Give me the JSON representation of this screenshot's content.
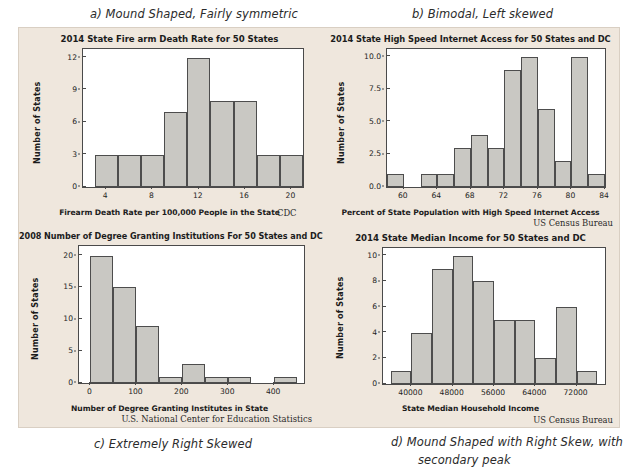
{
  "captions": {
    "a": "a) Mound Shaped, Fairly symmetric",
    "b": "b) Bimodal, Left skewed",
    "c": "c) Extremely Right Skewed",
    "d_line1": "d)  Mound Shaped with Right Skew, with",
    "d_line2": "secondary peak"
  },
  "colors": {
    "panel_background": "#efe7dd",
    "plot_background": "#ffffff",
    "bar_fill": "#c9c8c3",
    "bar_edge": "#4d4d4d",
    "axis": "#4a4a4a",
    "text": "#1c1c1c",
    "page_background": "#ffffff"
  },
  "chart_data": [
    {
      "id": "a",
      "type": "bar",
      "title": "2014 State Fire arm Death Rate for 50 States",
      "xlabel": "Firearm Death Rate  per 100,000 People in the State",
      "ylabel": "Number of States",
      "source": "CDC",
      "bin_width": 2,
      "bin_starts": [
        3,
        5,
        7,
        9,
        11,
        13,
        15,
        17,
        19
      ],
      "categories": [
        "3-5",
        "5-7",
        "7-9",
        "9-11",
        "11-13",
        "13-15",
        "15-17",
        "17-19",
        "19-21"
      ],
      "values": [
        3,
        3,
        3,
        7,
        12,
        8,
        8,
        3,
        3
      ],
      "xlim": [
        2,
        21
      ],
      "ylim": [
        0,
        12.8
      ],
      "xticks": [
        4,
        8,
        12,
        16,
        20
      ],
      "xticklabels": [
        "4",
        "8",
        "12",
        "16",
        "20"
      ],
      "yticks": [
        0,
        3,
        6,
        9,
        12
      ],
      "yticklabels": [
        "0",
        "3",
        "6",
        "9",
        "12"
      ],
      "grid": false,
      "legend": "none"
    },
    {
      "id": "b",
      "type": "bar",
      "title": "2014 State High Speed Internet Access for 50 States and DC",
      "xlabel": "Percent of State Population with High Speed Internet Access",
      "ylabel": "Number of States",
      "source": "US Census Bureau",
      "bin_width": 2,
      "bin_starts": [
        58,
        60,
        62,
        64,
        66,
        68,
        70,
        72,
        74,
        76,
        78,
        80,
        82
      ],
      "categories": [
        "58-60",
        "60-62",
        "62-64",
        "64-66",
        "66-68",
        "68-70",
        "70-72",
        "72-74",
        "74-76",
        "76-78",
        "78-80",
        "80-82",
        "82-84"
      ],
      "values": [
        1,
        0,
        1,
        1,
        3,
        4,
        3,
        9,
        10,
        6,
        2,
        10,
        1
      ],
      "xlim": [
        58,
        84
      ],
      "ylim": [
        0,
        10.6
      ],
      "xticks": [
        60,
        64,
        68,
        72,
        76,
        80,
        84
      ],
      "xticklabels": [
        "60",
        "64",
        "68",
        "72",
        "76",
        "80",
        "84"
      ],
      "yticks": [
        0,
        2.5,
        5.0,
        7.5,
        10.0
      ],
      "yticklabels": [
        "0.0",
        "2.5",
        "5.0",
        "7.5",
        "10.0"
      ],
      "grid": false,
      "legend": "none"
    },
    {
      "id": "c",
      "type": "bar",
      "title": "2008 Number of Degree Granting Institutions For 50 States and DC",
      "xlabel": "Number of Degree Granting Institutes in State",
      "ylabel": "Number of States",
      "source": "U.S. National Center for Education Statistics",
      "bin_width": 50,
      "bin_starts": [
        0,
        50,
        100,
        150,
        200,
        250,
        300,
        350,
        400
      ],
      "categories": [
        "0-50",
        "50-100",
        "100-150",
        "150-200",
        "200-250",
        "250-300",
        "300-350",
        "350-400",
        "400-450"
      ],
      "values": [
        20,
        15,
        9,
        1,
        3,
        1,
        1,
        0,
        1
      ],
      "xlim": [
        -25,
        465
      ],
      "ylim": [
        0,
        21.5
      ],
      "xticks": [
        0,
        100,
        200,
        300,
        400
      ],
      "xticklabels": [
        "0",
        "100",
        "200",
        "300",
        "400"
      ],
      "yticks": [
        0,
        5,
        10,
        15,
        20
      ],
      "yticklabels": [
        "0",
        "5",
        "10",
        "15",
        "20"
      ],
      "grid": false,
      "legend": "none"
    },
    {
      "id": "d",
      "type": "bar",
      "title": "2014 State Median Income for 50 States and DC",
      "xlabel": "State Median Household Income",
      "ylabel": "Number of States",
      "source": "US Census Bureau",
      "bin_width": 4000,
      "bin_starts": [
        36000,
        40000,
        44000,
        48000,
        52000,
        56000,
        60000,
        64000,
        68000,
        72000
      ],
      "categories": [
        "36000-40000",
        "40000-44000",
        "44000-48000",
        "48000-52000",
        "52000-56000",
        "56000-60000",
        "60000-64000",
        "64000-68000",
        "68000-72000",
        "72000-76000"
      ],
      "values": [
        1,
        4,
        9,
        10,
        8,
        5,
        5,
        2,
        6,
        1
      ],
      "xlim": [
        34500,
        77500
      ],
      "ylim": [
        0,
        10.6
      ],
      "xticks": [
        40000,
        48000,
        56000,
        64000,
        72000
      ],
      "xticklabels": [
        "40000",
        "48000",
        "56000",
        "64000",
        "72000"
      ],
      "yticks": [
        0,
        2,
        4,
        6,
        8,
        10
      ],
      "yticklabels": [
        "0",
        "2",
        "4",
        "6",
        "8",
        "10"
      ],
      "grid": false,
      "legend": "none"
    }
  ]
}
